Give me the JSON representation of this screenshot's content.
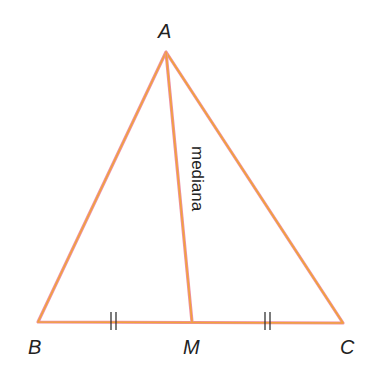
{
  "figure": {
    "type": "triangle with median",
    "vertices": {
      "A": {
        "label": "A",
        "x": 166,
        "y": 52
      },
      "B": {
        "label": "B",
        "x": 38,
        "y": 322
      },
      "C": {
        "label": "C",
        "x": 343,
        "y": 323
      },
      "M": {
        "label": "M",
        "x": 192,
        "y": 322
      }
    },
    "median_label": "mediana",
    "tick_marks": "||",
    "colors": {
      "line": "#f0a040",
      "line_edge": "#e88aa0",
      "text": "#222222"
    }
  }
}
